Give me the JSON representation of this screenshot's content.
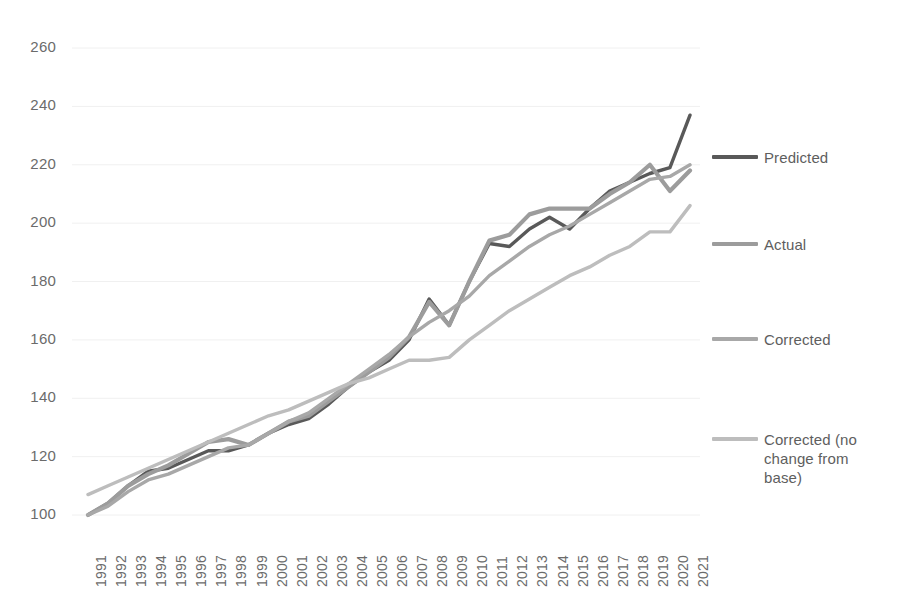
{
  "chart_data": {
    "type": "line",
    "title": "",
    "xlabel": "",
    "ylabel": "",
    "grid": true,
    "legend_position": "right",
    "xlim": [
      1991,
      2021
    ],
    "ylim": [
      100,
      260
    ],
    "ytick_step": 20,
    "categories": [
      1991,
      1992,
      1993,
      1994,
      1995,
      1996,
      1997,
      1998,
      1999,
      2000,
      2001,
      2002,
      2003,
      2004,
      2005,
      2006,
      2007,
      2008,
      2009,
      2010,
      2011,
      2012,
      2013,
      2014,
      2015,
      2016,
      2017,
      2018,
      2019,
      2020,
      2021
    ],
    "ytick_labels": [
      "100",
      "120",
      "140",
      "160",
      "180",
      "200",
      "220",
      "240",
      "260"
    ],
    "xtick_labels": [
      "1991",
      "1992",
      "1993",
      "1994",
      "1995",
      "1996",
      "1997",
      "1998",
      "1999",
      "2000",
      "2001",
      "2002",
      "2003",
      "2004",
      "2005",
      "2006",
      "2007",
      "2008",
      "2009",
      "2010",
      "2011",
      "2012",
      "2013",
      "2014",
      "2015",
      "2016",
      "2017",
      "2018",
      "2019",
      "2020",
      "2021"
    ],
    "series": [
      {
        "name": "Predicted",
        "color": "#595959",
        "width": 3.4,
        "values": [
          100,
          104,
          110,
          115,
          116,
          119,
          122,
          122,
          124,
          128,
          131,
          133,
          138,
          144,
          149,
          153,
          160,
          174,
          165,
          180,
          193,
          192,
          198,
          202,
          198,
          205,
          211,
          214,
          217,
          219,
          237
        ]
      },
      {
        "name": "Actual",
        "color": "#9c9c9c",
        "width": 4.2,
        "values": [
          100,
          104,
          110,
          114,
          117,
          121,
          125,
          126,
          124,
          128,
          132,
          134,
          139,
          144,
          149,
          154,
          161,
          173,
          165,
          180,
          194,
          196,
          203,
          205,
          205,
          205,
          210,
          214,
          220,
          211,
          218
        ]
      },
      {
        "name": "Corrected",
        "color": "#a8a8a8",
        "width": 3.4,
        "values": [
          100,
          103,
          108,
          112,
          114,
          117,
          120,
          123,
          124,
          128,
          132,
          135,
          140,
          145,
          150,
          155,
          161,
          166,
          170,
          175,
          182,
          187,
          192,
          196,
          199,
          203,
          207,
          211,
          215,
          216,
          220
        ]
      },
      {
        "name": "Corrected (no change from base)",
        "color": "#bdbdbd",
        "width": 3.4,
        "values": [
          107,
          110,
          113,
          116,
          119,
          122,
          125,
          128,
          131,
          134,
          136,
          139,
          142,
          145,
          147,
          150,
          153,
          153,
          154,
          160,
          165,
          170,
          174,
          178,
          182,
          185,
          189,
          192,
          197,
          197,
          206
        ]
      }
    ]
  },
  "legend": {
    "entries": [
      {
        "label": "Predicted"
      },
      {
        "label": "Actual"
      },
      {
        "label": "Corrected"
      },
      {
        "label": "Corrected (no change from base)"
      }
    ]
  }
}
